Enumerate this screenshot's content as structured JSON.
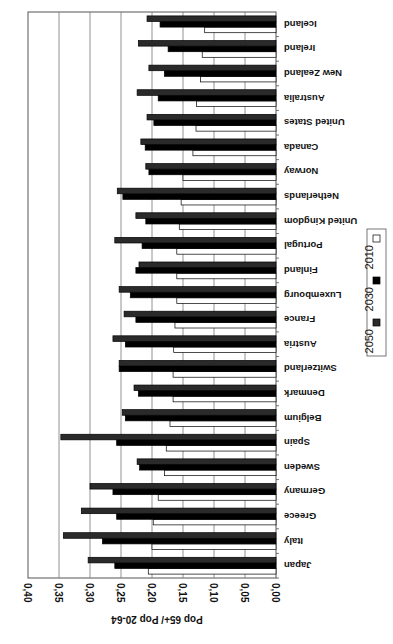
{
  "chart_data": {
    "type": "bar",
    "orientation": "horizontal",
    "rotation_deg": 180,
    "title": "",
    "xlabel": "Pop 65+/ Pop 20-64",
    "ylabel": "",
    "xlim": [
      0,
      0.4
    ],
    "x_ticks": [
      "0,00",
      "0,05",
      "0,10",
      "0,15",
      "0,20",
      "0,25",
      "0,30",
      "0,35",
      "0,40"
    ],
    "x_tick_values": [
      0,
      0.05,
      0.1,
      0.15,
      0.2,
      0.25,
      0.3,
      0.35,
      0.4
    ],
    "grid": true,
    "legend_position": "right",
    "categories": [
      "Japan",
      "Italy",
      "Greece",
      "Germany",
      "Sweden",
      "Spain",
      "Belgium",
      "Denmark",
      "Switzerland",
      "Austria",
      "France",
      "Luxembourg",
      "Finland",
      "Portugal",
      "United Kingdom",
      "Netherlands",
      "Norway",
      "Canada",
      "United States",
      "Australia",
      "New Zealand",
      "Ireland",
      "Iceland"
    ],
    "series": [
      {
        "name": "2010",
        "color": "#ffffff",
        "values": [
          0.206,
          0.2,
          0.198,
          0.19,
          0.18,
          0.177,
          0.171,
          0.166,
          0.166,
          0.165,
          0.163,
          0.16,
          0.16,
          0.16,
          0.156,
          0.153,
          0.15,
          0.134,
          0.129,
          0.128,
          0.122,
          0.119,
          0.115
        ]
      },
      {
        "name": "2030",
        "color": "#000000",
        "values": [
          0.26,
          0.28,
          0.257,
          0.263,
          0.22,
          0.257,
          0.243,
          0.222,
          0.253,
          0.243,
          0.226,
          0.235,
          0.226,
          0.216,
          0.21,
          0.247,
          0.205,
          0.211,
          0.197,
          0.19,
          0.18,
          0.174,
          0.187
        ]
      },
      {
        "name": "2050",
        "color": "#2a2a2a",
        "values": [
          0.303,
          0.343,
          0.314,
          0.3,
          0.224,
          0.347,
          0.248,
          0.229,
          0.253,
          0.263,
          0.245,
          0.253,
          0.221,
          0.26,
          0.226,
          0.256,
          0.21,
          0.218,
          0.208,
          0.224,
          0.205,
          0.222,
          0.208
        ]
      }
    ]
  }
}
